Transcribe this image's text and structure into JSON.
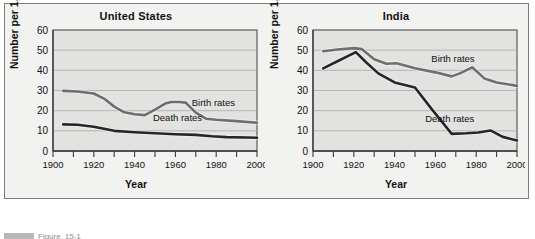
{
  "figure": {
    "caption_label": "Figure",
    "caption_number": "15-1"
  },
  "chart_data": [
    {
      "type": "line",
      "title": "United States",
      "xlabel": "Year",
      "ylabel": "Number per 1,000",
      "xlim": [
        1900,
        2000
      ],
      "ylim": [
        0,
        60
      ],
      "yticks": [
        0,
        10,
        20,
        30,
        40,
        50,
        60
      ],
      "xticks": [
        1900,
        1910,
        1920,
        1930,
        1940,
        1950,
        1960,
        1970,
        1980,
        1990,
        2000
      ],
      "xticklabels": [
        "1900",
        "",
        "1920",
        "",
        "1940",
        "",
        "1960",
        "",
        "1980",
        "",
        "2000"
      ],
      "grid": "horizontal",
      "legend": "inline-annotations",
      "series": [
        {
          "name": "Birth rates",
          "color": "#6e6e6e",
          "label_x": 1968,
          "label_y": 22.5,
          "x": [
            1905,
            1912,
            1920,
            1925,
            1930,
            1935,
            1940,
            1945,
            1950,
            1955,
            1958,
            1962,
            1965,
            1970,
            1975,
            1980,
            1990,
            2000
          ],
          "values": [
            29.8,
            29.5,
            28.5,
            26.0,
            22.0,
            19.2,
            18.2,
            17.8,
            20.5,
            23.5,
            24.3,
            24.3,
            24.0,
            19.0,
            16.0,
            15.5,
            14.8,
            14.0
          ]
        },
        {
          "name": "Death rates",
          "color": "#262626",
          "label_x": 1949,
          "label_y": 15.0,
          "x": [
            1905,
            1912,
            1920,
            1925,
            1930,
            1940,
            1950,
            1960,
            1970,
            1978,
            1985,
            1995,
            2000
          ],
          "values": [
            13.2,
            13.0,
            12.0,
            11.0,
            10.0,
            9.3,
            8.8,
            8.3,
            8.0,
            7.3,
            6.9,
            6.7,
            6.6
          ]
        }
      ]
    },
    {
      "type": "line",
      "title": "India",
      "xlabel": "Year",
      "ylabel": "Number per 1,000",
      "xlim": [
        1900,
        2000
      ],
      "ylim": [
        0,
        60
      ],
      "yticks": [
        0,
        10,
        20,
        30,
        40,
        50,
        60
      ],
      "xticks": [
        1900,
        1910,
        1920,
        1930,
        1940,
        1950,
        1960,
        1970,
        1980,
        1990,
        2000
      ],
      "xticklabels": [
        "1900",
        "",
        "1920",
        "",
        "1940",
        "",
        "1960",
        "",
        "1980",
        "",
        "2000"
      ],
      "grid": "horizontal",
      "legend": "inline-annotations",
      "series": [
        {
          "name": "Birth rates",
          "color": "#6e6e6e",
          "label_x": 1958,
          "label_y": 44.0,
          "x": [
            1905,
            1912,
            1920,
            1924,
            1930,
            1936,
            1941,
            1950,
            1960,
            1968,
            1972,
            1978,
            1984,
            1990,
            2000
          ],
          "values": [
            49.5,
            50.3,
            51.0,
            50.5,
            45.5,
            43.3,
            43.5,
            41.0,
            39.0,
            37.0,
            38.5,
            41.5,
            36.0,
            34.0,
            32.3
          ]
        },
        {
          "name": "Death rates",
          "color": "#262626",
          "label_x": 1955,
          "label_y": 14.5,
          "x": [
            1905,
            1912,
            1921,
            1926,
            1932,
            1940,
            1946,
            1950,
            1958,
            1968,
            1975,
            1981,
            1987,
            1993,
            2000
          ],
          "values": [
            41.0,
            44.5,
            49.0,
            44.0,
            38.5,
            34.0,
            32.5,
            31.5,
            21.0,
            8.5,
            8.8,
            9.2,
            10.2,
            7.0,
            5.2
          ]
        }
      ]
    }
  ]
}
